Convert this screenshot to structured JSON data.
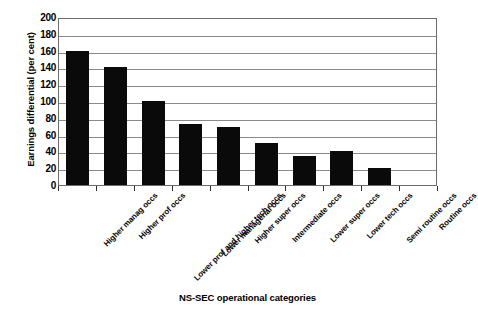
{
  "chart_data": {
    "type": "bar",
    "title": "",
    "xlabel": "NS-SEC operational categories",
    "ylabel": "Earnings differential (per cent)",
    "categories": [
      "Higher manag occs",
      "Higher prof occs",
      "Lower prof and higher tech occs",
      "Lower managerial occs",
      "Higher super occs",
      "Intermediate occs",
      "Lower super occs",
      "Lower tech occs",
      "Semi routine occs",
      "Routine occs"
    ],
    "values": [
      160,
      141,
      100,
      73,
      69,
      50,
      34,
      40,
      20,
      0
    ],
    "ylim": [
      0,
      200
    ],
    "yticks": [
      0,
      20,
      40,
      60,
      80,
      100,
      120,
      140,
      160,
      180,
      200
    ],
    "ytick_labels": [
      "0",
      "20",
      "40",
      "60",
      "80",
      "100",
      "120",
      "140",
      "160",
      "180",
      "200"
    ],
    "grid": true,
    "legend": "none",
    "bar_color": "#0a0a0a",
    "gridline_color": "#8a8a8a",
    "axis_color": "#6b6b6b"
  }
}
